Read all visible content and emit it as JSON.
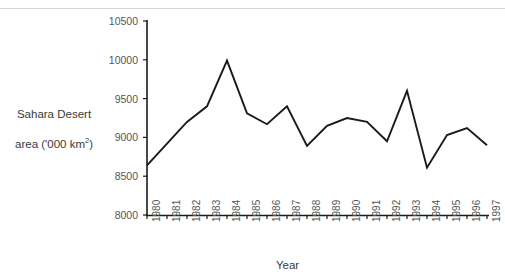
{
  "chart_data": {
    "type": "line",
    "title": "",
    "xlabel": "Year",
    "ylabel": "Sahara Desert area ('000 km2)",
    "ylabel_line1": "Sahara Desert",
    "ylabel_line2_pre": "area ('000 km",
    "ylabel_line2_sup": "2",
    "ylabel_line2_post": ")",
    "categories": [
      "1980",
      "1981",
      "1982",
      "1983",
      "1984",
      "1985",
      "1986",
      "1987",
      "1988",
      "1989",
      "1990",
      "1991",
      "1992",
      "1993",
      "1994",
      "1995",
      "1996",
      "1997"
    ],
    "values": [
      8640,
      8920,
      9200,
      9400,
      9990,
      9310,
      9170,
      9400,
      8890,
      9150,
      9250,
      9200,
      8950,
      9600,
      8610,
      9030,
      9120,
      8900
    ],
    "series": [
      {
        "name": "Sahara Desert area",
        "color": "#1a1a1a",
        "values": [
          8640,
          8920,
          9200,
          9400,
          9990,
          9310,
          9170,
          9400,
          8890,
          9150,
          9250,
          9200,
          8950,
          9600,
          8610,
          9030,
          9120,
          8900
        ]
      }
    ],
    "ylim": [
      8000,
      10500
    ],
    "ytick_values": [
      8000,
      8500,
      9000,
      9500,
      10000,
      10500
    ],
    "ytick_labels": [
      "8000",
      "8500",
      "9000",
      "9500",
      "10000",
      "10500"
    ],
    "grid": false,
    "legend": "none",
    "markers": false,
    "line_color": "#1a1a1a",
    "axis_color": "#1a1a1a",
    "label_color": "#565656",
    "background": "#ffffff"
  },
  "axes": {
    "x_title": "Year"
  },
  "geometry": {
    "plot_left": 147,
    "plot_right": 487,
    "plot_top": 21,
    "plot_bottom": 215
  }
}
